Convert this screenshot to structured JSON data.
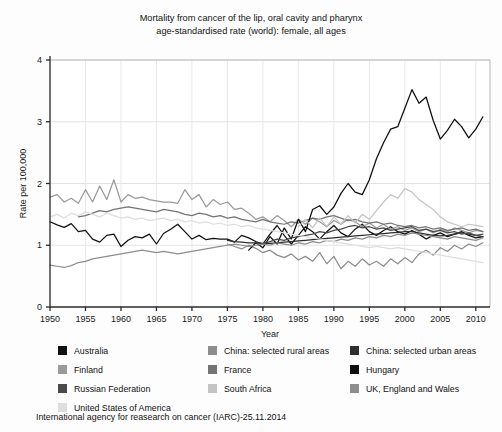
{
  "title": {
    "line1": "Mortality from cancer of the lip, oral cavity and pharynx",
    "line2": "age-standardised rate (world): female, all ages"
  },
  "footer": "International agency for reasearch on cancer (IARC)-25.11.2014",
  "axes": {
    "xlabel": "Year",
    "ylabel": "Rate per 100,000",
    "xticks": [
      "1950",
      "1955",
      "1960",
      "1965",
      "1970",
      "1975",
      "1980",
      "1985",
      "1990",
      "1995",
      "2000",
      "2005",
      "2010"
    ],
    "yticks": [
      "0",
      "1",
      "2",
      "3",
      "4"
    ]
  },
  "legend": {
    "rows": [
      [
        {
          "label": "Australia",
          "color": "#111111"
        },
        {
          "label": "China: selected rural areas",
          "color": "#8d8d8d"
        },
        {
          "label": "China: selected urban areas",
          "color": "#2e2e2e"
        }
      ],
      [
        {
          "label": "Finland",
          "color": "#9a9a9a"
        },
        {
          "label": "France",
          "color": "#747474"
        },
        {
          "label": "Hungary",
          "color": "#0d0d0d"
        }
      ],
      [
        {
          "label": "Russian Federation",
          "color": "#4a4a4a"
        },
        {
          "label": "South Africa",
          "color": "#c4c4c4"
        },
        {
          "label": "UK, England and Wales",
          "color": "#8d8d8d"
        }
      ],
      [
        {
          "label": "United States of America",
          "color": "#dedede"
        }
      ]
    ]
  },
  "chart_data": {
    "type": "line",
    "title": "Mortality from cancer of the lip, oral cavity and pharynx age-standardised rate (world): female, all ages",
    "xlabel": "Year",
    "ylabel": "Rate per 100,000",
    "xlim": [
      1950,
      2012
    ],
    "ylim": [
      0,
      4
    ],
    "grid": true,
    "legend_position": "bottom",
    "x": [
      1950,
      1951,
      1952,
      1953,
      1954,
      1955,
      1956,
      1957,
      1958,
      1959,
      1960,
      1961,
      1962,
      1963,
      1964,
      1965,
      1966,
      1967,
      1968,
      1969,
      1970,
      1971,
      1972,
      1973,
      1974,
      1975,
      1976,
      1977,
      1978,
      1979,
      1980,
      1981,
      1982,
      1983,
      1984,
      1985,
      1986,
      1987,
      1988,
      1989,
      1990,
      1991,
      1992,
      1993,
      1994,
      1995,
      1996,
      1997,
      1998,
      1999,
      2000,
      2001,
      2002,
      2003,
      2004,
      2005,
      2006,
      2007,
      2008,
      2009,
      2010,
      2011
    ],
    "series": [
      {
        "name": "Australia",
        "color": "#111111",
        "values": [
          1.38,
          1.33,
          1.29,
          1.35,
          1.22,
          1.24,
          1.1,
          1.05,
          1.16,
          1.18,
          0.98,
          1.08,
          1.14,
          1.12,
          1.18,
          1.02,
          1.19,
          1.26,
          1.34,
          1.22,
          1.1,
          1.16,
          1.09,
          1.11,
          1.1,
          1.1,
          1.05,
          1.16,
          1.12,
          1.06,
          1.02,
          1.18,
          1.32,
          1.16,
          1.02,
          1.16,
          1.3,
          1.22,
          1.1,
          1.22,
          1.32,
          1.2,
          1.14,
          1.26,
          1.34,
          1.22,
          1.16,
          1.24,
          1.3,
          1.22,
          1.18,
          1.24,
          1.18,
          1.1,
          1.16,
          1.2,
          1.14,
          1.18,
          1.22,
          1.16,
          1.12,
          1.14
        ]
      },
      {
        "name": "China: selected rural areas",
        "color": "#8d8d8d",
        "values": [
          null,
          null,
          null,
          null,
          null,
          null,
          null,
          null,
          null,
          null,
          null,
          null,
          null,
          null,
          null,
          null,
          null,
          null,
          null,
          null,
          null,
          null,
          null,
          null,
          null,
          1.02,
          0.98,
          0.94,
          1.0,
          0.95,
          0.88,
          0.92,
          0.84,
          0.8,
          0.86,
          0.76,
          0.82,
          0.74,
          0.88,
          0.7,
          0.82,
          0.62,
          0.74,
          0.66,
          0.78,
          0.68,
          0.74,
          0.66,
          0.78,
          0.7,
          0.8,
          0.72,
          0.86,
          0.92,
          0.84,
          0.96,
          0.9,
          1.0,
          0.94,
          1.02,
          0.98,
          1.04
        ]
      },
      {
        "name": "China: selected urban areas",
        "color": "#2e2e2e",
        "values": [
          null,
          null,
          null,
          null,
          null,
          null,
          null,
          null,
          null,
          null,
          null,
          null,
          null,
          null,
          null,
          null,
          null,
          null,
          null,
          null,
          null,
          null,
          null,
          null,
          null,
          1.08,
          1.06,
          1.05,
          1.04,
          1.04,
          1.03,
          1.03,
          1.04,
          1.05,
          1.06,
          1.07,
          1.08,
          1.09,
          1.1,
          1.11,
          1.12,
          1.13,
          1.14,
          1.15,
          1.16,
          1.17,
          1.18,
          1.19,
          1.2,
          1.21,
          1.22,
          1.22,
          1.2,
          1.18,
          1.16,
          1.15,
          1.16,
          1.18,
          1.2,
          1.18,
          1.16,
          1.14
        ]
      },
      {
        "name": "Finland",
        "color": "#9a9a9a",
        "values": [
          1.78,
          1.82,
          1.7,
          1.76,
          1.68,
          1.9,
          1.7,
          1.96,
          1.74,
          2.06,
          1.7,
          1.82,
          1.76,
          1.78,
          1.74,
          1.72,
          1.7,
          1.7,
          1.68,
          1.9,
          1.74,
          1.82,
          1.62,
          1.74,
          1.66,
          1.7,
          1.58,
          1.6,
          1.52,
          1.42,
          1.46,
          1.38,
          1.48,
          1.4,
          1.3,
          1.42,
          1.34,
          1.44,
          1.38,
          1.3,
          1.4,
          1.34,
          1.42,
          1.38,
          1.3,
          1.36,
          1.28,
          1.34,
          1.26,
          1.3,
          1.24,
          1.28,
          1.22,
          1.26,
          1.2,
          1.26,
          1.22,
          1.28,
          1.24,
          1.2,
          1.24,
          1.22
        ]
      },
      {
        "name": "France",
        "color": "#747474",
        "values": [
          null,
          null,
          null,
          null,
          1.46,
          1.48,
          1.52,
          1.56,
          1.54,
          1.58,
          1.6,
          1.62,
          1.6,
          1.58,
          1.56,
          1.54,
          1.58,
          1.56,
          1.54,
          1.5,
          1.48,
          1.52,
          1.5,
          1.46,
          1.48,
          1.44,
          1.46,
          1.42,
          1.4,
          1.38,
          1.42,
          1.38,
          1.36,
          1.34,
          1.38,
          1.36,
          1.4,
          1.44,
          1.42,
          1.46,
          1.48,
          1.44,
          1.4,
          1.42,
          1.38,
          1.36,
          1.38,
          1.34,
          1.36,
          1.32,
          1.3,
          1.32,
          1.28,
          1.3,
          1.26,
          1.28,
          1.24,
          1.26,
          1.28,
          1.24,
          1.26,
          1.22
        ]
      },
      {
        "name": "Hungary",
        "color": "#0d0d0d",
        "values": [
          null,
          null,
          null,
          null,
          null,
          null,
          null,
          null,
          null,
          null,
          null,
          null,
          null,
          null,
          null,
          null,
          null,
          null,
          null,
          null,
          null,
          null,
          null,
          null,
          null,
          null,
          null,
          null,
          0.92,
          1.04,
          0.96,
          1.14,
          1.02,
          1.28,
          1.1,
          1.42,
          1.22,
          1.58,
          1.64,
          1.5,
          1.62,
          1.84,
          2.0,
          1.86,
          1.82,
          2.06,
          2.4,
          2.66,
          2.88,
          2.92,
          3.22,
          3.52,
          3.3,
          3.4,
          3.02,
          2.72,
          2.86,
          3.04,
          2.92,
          2.74,
          2.88,
          3.08
        ]
      },
      {
        "name": "Russian Federation",
        "color": "#4a4a4a",
        "values": [
          null,
          null,
          null,
          null,
          null,
          null,
          null,
          null,
          null,
          null,
          null,
          null,
          null,
          null,
          null,
          null,
          null,
          null,
          null,
          null,
          null,
          null,
          null,
          null,
          null,
          null,
          null,
          null,
          null,
          1.04,
          1.02,
          1.06,
          1.1,
          1.08,
          1.12,
          1.14,
          1.16,
          1.18,
          1.22,
          1.2,
          1.24,
          1.26,
          1.3,
          1.32,
          1.28,
          1.3,
          1.26,
          1.28,
          1.24,
          1.26,
          1.28,
          1.3,
          1.24,
          1.26,
          1.22,
          1.24,
          1.2,
          1.22,
          1.18,
          1.2,
          1.16,
          1.18
        ]
      },
      {
        "name": "South Africa",
        "color": "#c4c4c4",
        "values": [
          null,
          null,
          null,
          null,
          null,
          null,
          null,
          null,
          null,
          null,
          null,
          null,
          null,
          null,
          null,
          null,
          null,
          null,
          null,
          null,
          null,
          null,
          null,
          null,
          null,
          null,
          null,
          null,
          null,
          null,
          null,
          null,
          null,
          null,
          null,
          1.3,
          1.42,
          1.28,
          1.44,
          1.3,
          1.46,
          1.34,
          1.48,
          1.36,
          1.5,
          1.42,
          1.56,
          1.7,
          1.82,
          1.76,
          1.92,
          1.86,
          1.74,
          1.66,
          1.58,
          1.46,
          1.38,
          1.34,
          1.3,
          1.34,
          1.32,
          1.3
        ]
      },
      {
        "name": "UK, England and Wales",
        "color": "#8d8d8d",
        "values": [
          0.68,
          0.66,
          0.64,
          0.67,
          0.72,
          0.74,
          0.78,
          0.8,
          0.82,
          0.84,
          0.86,
          0.88,
          0.9,
          0.92,
          0.9,
          0.88,
          0.9,
          0.88,
          0.86,
          0.88,
          0.9,
          0.92,
          0.94,
          0.96,
          0.98,
          1.0,
          1.02,
          1.0,
          0.98,
          1.0,
          1.02,
          1.0,
          1.04,
          1.02,
          1.0,
          1.04,
          1.02,
          1.06,
          1.04,
          1.08,
          1.06,
          1.1,
          1.08,
          1.12,
          1.1,
          1.14,
          1.12,
          1.16,
          1.14,
          1.18,
          1.16,
          1.2,
          1.18,
          1.16,
          1.14,
          1.12,
          1.1,
          1.14,
          1.12,
          1.1,
          1.08,
          1.12
        ]
      },
      {
        "name": "United States of America",
        "color": "#dedede",
        "values": [
          1.46,
          1.5,
          1.44,
          1.52,
          1.48,
          1.54,
          1.5,
          1.46,
          1.52,
          1.48,
          1.44,
          1.46,
          1.42,
          1.44,
          1.4,
          1.42,
          1.44,
          1.4,
          1.42,
          1.38,
          1.4,
          1.36,
          1.38,
          1.34,
          1.36,
          1.32,
          1.34,
          1.3,
          1.32,
          1.28,
          1.26,
          1.24,
          1.22,
          1.2,
          1.18,
          1.16,
          1.14,
          1.12,
          1.1,
          1.08,
          1.06,
          1.04,
          1.02,
          1.0,
          0.98,
          0.96,
          0.98,
          0.96,
          0.94,
          0.96,
          0.94,
          0.92,
          0.9,
          0.88,
          0.86,
          0.84,
          0.82,
          0.8,
          0.78,
          0.76,
          0.74,
          0.72
        ]
      }
    ]
  }
}
